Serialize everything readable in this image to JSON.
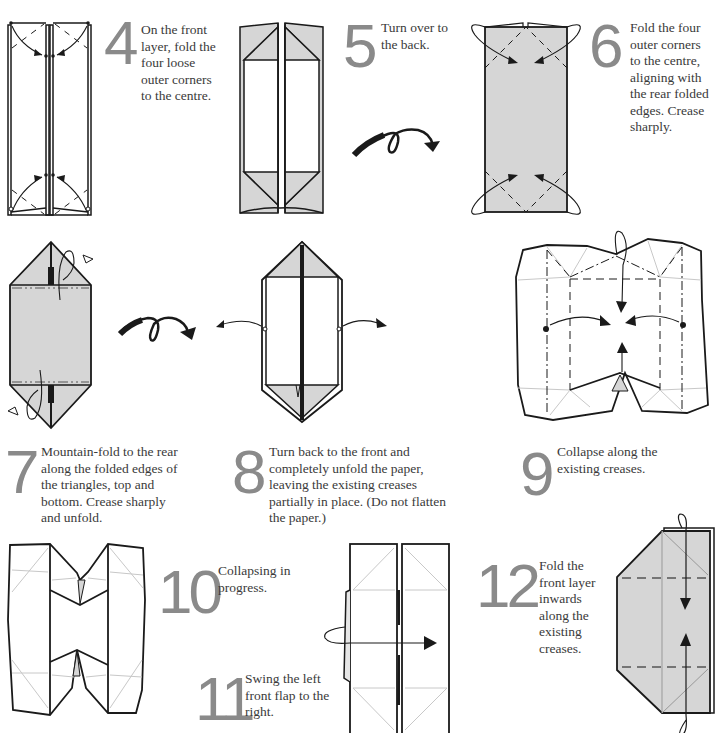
{
  "diagram": {
    "type": "origami-instructions",
    "paper_colors": {
      "front": "#ffffff",
      "back": "#d6d6d6",
      "line": "#1a1a1a",
      "crease_light": "#c8c8c8",
      "step_number": "#8a8a8a"
    },
    "steps": [
      {
        "number": "4",
        "text": "On the front layer, fold the four loose outer corners to the centre.",
        "lines": [
          "On the front",
          "layer, fold the",
          "four loose",
          "outer corners",
          "to the centre."
        ]
      },
      {
        "number": "5",
        "text": "Turn over to the back.",
        "lines": [
          "Turn over to",
          "the back."
        ]
      },
      {
        "number": "6",
        "text": "Fold the four outer corners to the centre, aligning with the rear folded edges. Crease sharply.",
        "lines": [
          "Fold the four",
          "outer corners",
          "to the centre,",
          "aligning with",
          "the rear folded",
          "edges. Crease",
          "sharply."
        ]
      },
      {
        "number": "7",
        "text": "Mountain-fold to the rear along the folded edges of the triangles, top and bottom. Crease sharply and unfold.",
        "lines": [
          "Mountain-fold to the rear",
          "along the folded edges of",
          "the triangles, top and",
          "bottom. Crease sharply",
          "and unfold."
        ]
      },
      {
        "number": "8",
        "text": "Turn back to the front and completely unfold the paper, leaving the existing creases partially in place. (Do not flatten the paper.)",
        "lines": [
          "Turn back to the front and",
          "completely unfold the paper,",
          "leaving the existing creases",
          "partially in place. (Do not flatten",
          "the paper.)"
        ]
      },
      {
        "number": "9",
        "text": "Collapse along the existing creases.",
        "lines": [
          "Collapse along the",
          "existing creases."
        ]
      },
      {
        "number": "10",
        "text": "Collapsing in progress.",
        "lines": [
          "Collapsing in",
          "progress."
        ]
      },
      {
        "number": "11",
        "text": "Swing the left front flap to the right.",
        "lines": [
          "Swing the left",
          "front flap to the",
          "right."
        ]
      },
      {
        "number": "12",
        "text": "Fold the front layer inwards along the existing creases.",
        "lines": [
          "Fold the",
          "front layer",
          "inwards",
          "along the",
          "existing",
          "creases."
        ]
      }
    ],
    "symbols": [
      "valley-fold-arrow",
      "mountain-fold-line",
      "turn-over-arrow",
      "unfold-arrow",
      "reference-dot"
    ]
  }
}
